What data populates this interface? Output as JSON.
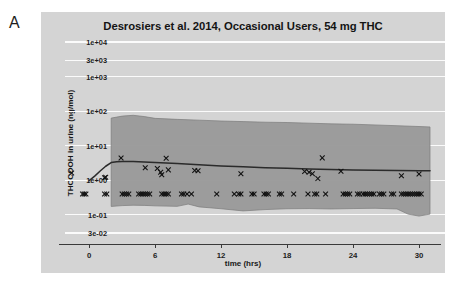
{
  "figure": {
    "panel_letter": "A",
    "background_color": "#ffffff",
    "panel_color": "#d4d4d4",
    "band_color": "#9a9a9a",
    "median_color": "#2b2b2b",
    "gridline_color": "#fbfbfb",
    "marker_color": "#101010"
  },
  "chart_data": {
    "type": "line",
    "title": "Desrosiers et al. 2014, Occasional Users, 54 mg THC",
    "subtitle": "",
    "xlabel": "time (hrs)",
    "ylabel": "THCCOOH in urine (ng/mol)",
    "yscale": "log",
    "xlim": [
      -2.2,
      32.0
    ],
    "ylim": [
      0.02,
      15000
    ],
    "grid": true,
    "legend": "none",
    "xticks": [
      0,
      6,
      12,
      18,
      24,
      30
    ],
    "xticklabels": [
      "0",
      "6",
      "12",
      "18",
      "24",
      "30"
    ],
    "yticks": [
      10000,
      3000,
      1000,
      100,
      10,
      1,
      0.1,
      0.03
    ],
    "yticklabels": [
      "1e+04",
      "3e+03",
      "1e+03",
      "1e+02",
      "1e+01",
      "1e+00",
      "1e-01",
      "3e-02"
    ],
    "annotations": [],
    "series": [
      {
        "name": "Predicted median",
        "type": "line",
        "x": [
          0.0,
          0.5,
          1.0,
          1.5,
          2.0,
          2.5,
          3.0,
          4.0,
          5.0,
          6.0,
          8.0,
          10.0,
          12.0,
          14.0,
          16.0,
          18.0,
          20.0,
          22.0,
          24.0,
          26.0,
          28.0,
          30.0,
          31.0
        ],
        "y": [
          0.98,
          1.32,
          1.85,
          2.55,
          3.25,
          3.45,
          3.5,
          3.48,
          3.4,
          3.3,
          3.05,
          2.8,
          2.6,
          2.45,
          2.32,
          2.22,
          2.12,
          2.05,
          2.0,
          1.96,
          1.92,
          1.9,
          1.9
        ]
      },
      {
        "name": "95% prediction interval upper",
        "type": "band-upper",
        "x": [
          2.0,
          3.0,
          4.0,
          5.0,
          6.0,
          8.0,
          10.0,
          12.0,
          14.0,
          16.0,
          18.0,
          20.0,
          22.0,
          24.0,
          26.0,
          28.0,
          30.0,
          31.0
        ],
        "y": [
          63.0,
          72.0,
          76.0,
          70.0,
          62.0,
          58.0,
          55.0,
          52.0,
          50.0,
          48.0,
          47.0,
          45.0,
          43.0,
          42.0,
          40.0,
          38.0,
          36.0,
          35.0
        ]
      },
      {
        "name": "95% prediction interval lower",
        "type": "band-lower",
        "x": [
          2.0,
          3.0,
          4.0,
          5.0,
          6.0,
          8.0,
          9.0,
          10.0,
          12.0,
          14.0,
          16.0,
          18.0,
          20.0,
          22.0,
          24.0,
          26.0,
          28.0,
          29.0,
          30.0,
          31.0
        ],
        "y": [
          0.175,
          0.185,
          0.19,
          0.188,
          0.182,
          0.176,
          0.205,
          0.17,
          0.15,
          0.13,
          0.142,
          0.15,
          0.152,
          0.148,
          0.152,
          0.155,
          0.148,
          0.105,
          0.092,
          0.105
        ]
      },
      {
        "name": "Observed concentrations",
        "type": "scatter",
        "marker": "x",
        "points": [
          [
            -1.6,
            1.62
          ],
          [
            1.4,
            1.18
          ],
          [
            1.5,
            1.22
          ],
          [
            2.9,
            4.4
          ],
          [
            5.1,
            2.3
          ],
          [
            6.2,
            2.2
          ],
          [
            6.5,
            1.72
          ],
          [
            6.6,
            1.45
          ],
          [
            7.0,
            4.35
          ],
          [
            7.2,
            2.0
          ],
          [
            9.6,
            1.92
          ],
          [
            9.9,
            1.9
          ],
          [
            13.8,
            1.55
          ],
          [
            19.6,
            1.8
          ],
          [
            20.0,
            1.72
          ],
          [
            20.3,
            1.55
          ],
          [
            20.8,
            1.12
          ],
          [
            21.2,
            4.45
          ],
          [
            22.9,
            1.82
          ],
          [
            28.4,
            1.35
          ],
          [
            30.0,
            1.52
          ],
          [
            -0.6,
            0.4
          ],
          [
            -0.45,
            0.4
          ],
          [
            -0.3,
            0.4
          ],
          [
            1.4,
            0.4
          ],
          [
            1.6,
            0.4
          ],
          [
            3.0,
            0.4
          ],
          [
            3.2,
            0.4
          ],
          [
            3.4,
            0.4
          ],
          [
            3.6,
            0.4
          ],
          [
            4.5,
            0.4
          ],
          [
            4.7,
            0.4
          ],
          [
            4.9,
            0.4
          ],
          [
            5.1,
            0.4
          ],
          [
            5.3,
            0.4
          ],
          [
            5.5,
            0.4
          ],
          [
            6.6,
            0.4
          ],
          [
            6.8,
            0.4
          ],
          [
            7.0,
            0.4
          ],
          [
            7.2,
            0.4
          ],
          [
            8.4,
            0.4
          ],
          [
            8.6,
            0.4
          ],
          [
            8.9,
            0.4
          ],
          [
            9.3,
            0.4
          ],
          [
            11.6,
            0.4
          ],
          [
            13.2,
            0.4
          ],
          [
            13.6,
            0.4
          ],
          [
            13.8,
            0.4
          ],
          [
            14.8,
            0.4
          ],
          [
            15.0,
            0.4
          ],
          [
            15.9,
            0.4
          ],
          [
            16.1,
            0.4
          ],
          [
            16.3,
            0.4
          ],
          [
            17.3,
            0.4
          ],
          [
            17.5,
            0.4
          ],
          [
            18.6,
            0.4
          ],
          [
            19.9,
            0.4
          ],
          [
            20.5,
            0.4
          ],
          [
            20.7,
            0.4
          ],
          [
            21.5,
            0.4
          ],
          [
            23.1,
            0.4
          ],
          [
            23.3,
            0.4
          ],
          [
            23.5,
            0.4
          ],
          [
            23.7,
            0.4
          ],
          [
            24.4,
            0.4
          ],
          [
            24.6,
            0.4
          ],
          [
            24.9,
            0.4
          ],
          [
            25.1,
            0.4
          ],
          [
            25.3,
            0.4
          ],
          [
            25.5,
            0.4
          ],
          [
            25.7,
            0.4
          ],
          [
            25.9,
            0.4
          ],
          [
            26.4,
            0.4
          ],
          [
            26.6,
            0.4
          ],
          [
            26.8,
            0.4
          ],
          [
            27.5,
            0.4
          ],
          [
            27.7,
            0.4
          ],
          [
            28.4,
            0.4
          ],
          [
            28.6,
            0.4
          ],
          [
            28.8,
            0.4
          ],
          [
            29.0,
            0.4
          ],
          [
            29.2,
            0.4
          ],
          [
            29.4,
            0.4
          ],
          [
            29.6,
            0.4
          ],
          [
            29.8,
            0.4
          ],
          [
            30.0,
            0.4
          ],
          [
            30.2,
            0.4
          ]
        ]
      }
    ]
  }
}
